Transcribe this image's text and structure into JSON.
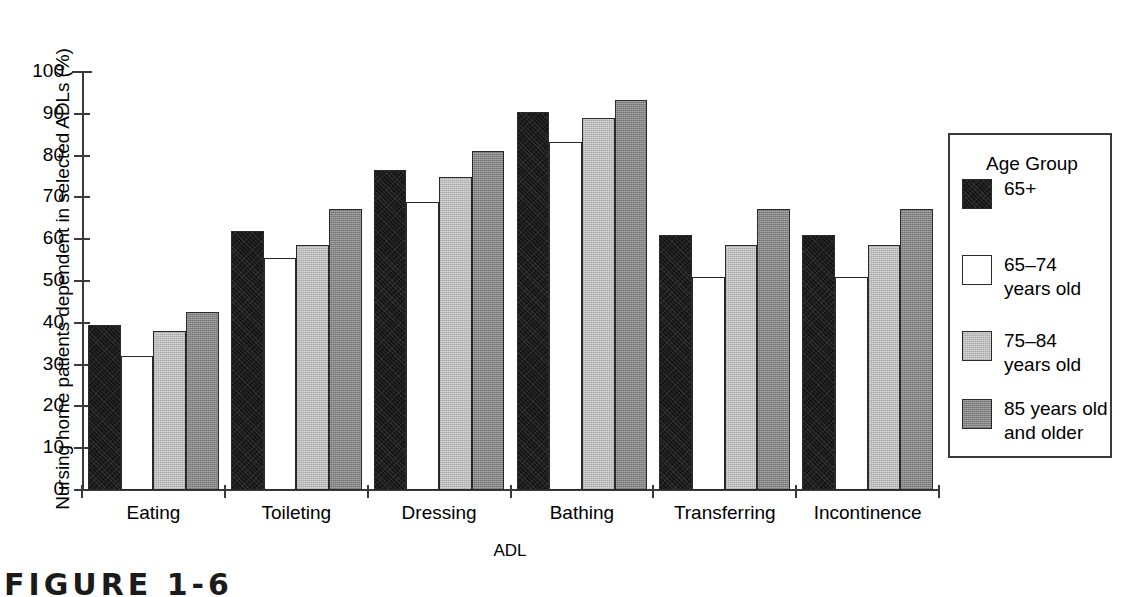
{
  "chart_data": {
    "type": "bar",
    "title": "",
    "xlabel": "ADL",
    "ylabel": "Nursing home patients dependent in selected ADLs (%)",
    "ylim": [
      0,
      100
    ],
    "ytick_labels": [
      "100",
      "90",
      "80",
      "70",
      "60",
      "50",
      "40",
      "30",
      "20",
      "10",
      "0"
    ],
    "ytick_values": [
      100,
      90,
      80,
      70,
      60,
      50,
      40,
      30,
      20,
      10,
      0
    ],
    "grid": false,
    "legend_position": "right",
    "legend_title": "Age Group",
    "categories": [
      "Eating",
      "Toileting",
      "Dressing",
      "Bathing",
      "Transferring",
      "Incontinence"
    ],
    "series": [
      {
        "name": "65+",
        "color": "#151515",
        "values": [
          39.5,
          62.0,
          76.5,
          90.5,
          61.0,
          61.0
        ]
      },
      {
        "name": "65–74 years old",
        "color": "#ffffff",
        "values": [
          32.0,
          55.5,
          69.0,
          83.3,
          51.0,
          51.0
        ]
      },
      {
        "name": "75–84 years old",
        "color": "#d8d8d8",
        "values": [
          38.0,
          58.5,
          75.0,
          89.0,
          58.5,
          58.5
        ]
      },
      {
        "name": "85 years old and older",
        "color": "#949494",
        "values": [
          42.7,
          67.2,
          81.0,
          93.3,
          67.2,
          67.2
        ]
      }
    ]
  },
  "legend": {
    "title": "Age Group",
    "entries": [
      {
        "label": "65+",
        "swatch": "black"
      },
      {
        "label": "65–74\nyears old",
        "swatch": "white"
      },
      {
        "label": "75–84\nyears old",
        "swatch": "light-gray"
      },
      {
        "label": "85 years old\nand older",
        "swatch": "medium-gray"
      }
    ]
  },
  "caption": {
    "text": "FIGURE 1-6"
  }
}
